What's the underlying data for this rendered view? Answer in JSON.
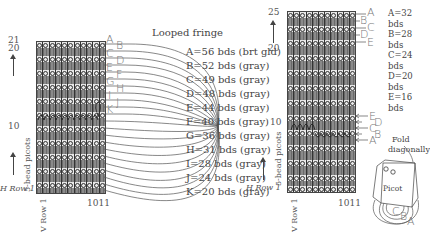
{
  "left_diagram": {
    "title": "Looped fringe",
    "row_top_labels": [
      "21",
      "20"
    ],
    "row_mid_label": "10",
    "h_row_label": "H Row 1",
    "v_row_label": "V Row 1",
    "column_label": "1011",
    "picot_label": "5-bead picots",
    "letters": [
      "A",
      "B",
      "C",
      "D",
      "E",
      "F",
      "G",
      "H",
      "I",
      "J",
      "K"
    ],
    "legend": [
      "A=56 bds (brt gld)",
      "B=52 bds (gray)",
      "C=49 bds (gray)",
      "D=48 bds (gray)",
      "E=44 bds (gray)",
      "F=40 bds (gray)",
      "G=36 bds (gray)",
      "H=31 bds (gray)",
      "I=28 bds (gray)",
      "J=24 bds (gray)",
      "K=20 bds (gray)"
    ]
  },
  "right_diagram": {
    "row_top_labels": [
      "25",
      "20"
    ],
    "row_mid_label": "10",
    "h_row_label": "H Row 1",
    "v_row_label": "V Row 1",
    "column_label": "1011",
    "picot_label": "5-bead picots",
    "top_letters": [
      "A",
      "B",
      "C",
      "D",
      "E"
    ],
    "mid_letters": [
      "E",
      "D",
      "C",
      "B",
      "A"
    ],
    "legend": [
      "A=32 bds",
      "B=28 bds",
      "C=24 bds",
      "D=20 bds",
      "E=16 bds"
    ],
    "fold_label_1": "Fold",
    "fold_label_2": "diagonally",
    "picot_tag": "Picot",
    "fold_letters": [
      "C",
      "B",
      "A"
    ]
  },
  "colors": {
    "grid_dark": "#777777",
    "grid_light": "#e8e8e8",
    "line": "#444444",
    "text": "#555555"
  }
}
